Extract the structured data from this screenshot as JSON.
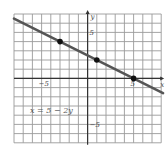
{
  "figure": {
    "equation_label": "x = 5 − 2y",
    "x_axis_label": "x",
    "y_axis_label": "y",
    "x_tick_labels": [
      {
        "value": -5,
        "text": "−5"
      },
      {
        "value": 5,
        "text": "5"
      }
    ],
    "y_tick_labels": [
      {
        "value": 5,
        "text": "5"
      },
      {
        "value": -5,
        "text": "−5"
      }
    ],
    "x_range": [
      -8,
      8
    ],
    "y_range": [
      -7,
      7
    ],
    "grid": true,
    "grid_step": 1,
    "points": [
      {
        "x": -3,
        "y": 4
      },
      {
        "x": 1,
        "y": 2
      },
      {
        "x": 5,
        "y": 0
      }
    ],
    "line": {
      "equation": "x = 5 - 2y",
      "color": "#555555"
    }
  },
  "chart_data": {
    "type": "line",
    "title": "",
    "xlabel": "x",
    "ylabel": "y",
    "xlim": [
      -8,
      8
    ],
    "ylim": [
      -7,
      7
    ],
    "grid": true,
    "series": [
      {
        "name": "x = 5 − 2y",
        "x": [
          -8,
          -3,
          1,
          5,
          8
        ],
        "y": [
          6.5,
          4,
          2,
          0,
          -1.5
        ]
      }
    ],
    "marked_points": [
      [
        -3,
        4
      ],
      [
        1,
        2
      ],
      [
        5,
        0
      ]
    ],
    "annotations": [
      "x = 5 − 2y"
    ],
    "x_ticks_labeled": [
      -5,
      5
    ],
    "y_ticks_labeled": [
      -5,
      5
    ]
  }
}
